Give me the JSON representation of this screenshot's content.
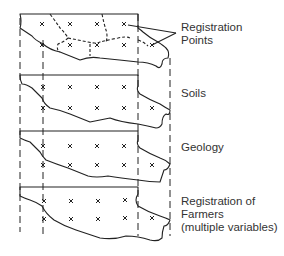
{
  "diagram": {
    "type": "stacked map overlay layers",
    "labels": {
      "registration_points": "Registration\nPoints",
      "soils": "Soils",
      "geology": "Geology",
      "farmers": "Registration of\nFarmers\n(multiple variables)"
    },
    "layers": [
      {
        "name": "Registration Points",
        "top": 14
      },
      {
        "name": "Soils",
        "top": 75
      },
      {
        "name": "Geology",
        "top": 131
      },
      {
        "name": "Registration of Farmers (multiple variables)",
        "top": 187
      }
    ],
    "colors": {
      "line": "#222222",
      "text": "#333333",
      "background": "#ffffff"
    }
  }
}
